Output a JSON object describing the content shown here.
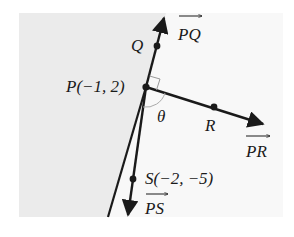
{
  "diagram": {
    "type": "geometry-vectors-plane",
    "colors": {
      "background": "#ffffff",
      "left_region": "#ebebeb",
      "right_region": "#f8f8f8",
      "ink": "#1a1a1a",
      "arc": "#aaaaaa"
    },
    "points": {
      "P": {
        "label": "P(−1, 2)",
        "name": "P",
        "coords": "(−1, 2)"
      },
      "Q": {
        "label": "Q",
        "name": "Q"
      },
      "R": {
        "label": "R",
        "name": "R"
      },
      "S": {
        "label": "S(−2, −5)",
        "name": "S",
        "coords": "(−2, −5)"
      }
    },
    "vectors": {
      "PQ": {
        "label": "PQ"
      },
      "PR": {
        "label": "PR"
      },
      "PS": {
        "label": "PS"
      }
    },
    "angle": {
      "label": "θ"
    },
    "annotations": {
      "right_angle": "between PQ and PR"
    }
  }
}
